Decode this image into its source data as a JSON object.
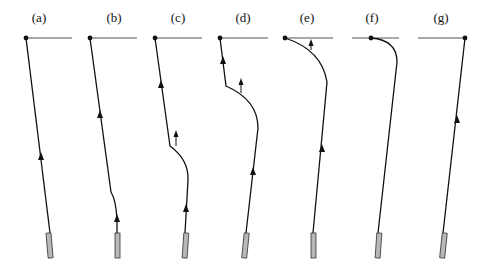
{
  "figure": {
    "panels": [
      {
        "id": "a",
        "label": "(a)"
      },
      {
        "id": "b",
        "label": "(b)"
      },
      {
        "id": "c",
        "label": "(c)"
      },
      {
        "id": "d",
        "label": "(d)"
      },
      {
        "id": "e",
        "label": "(e)"
      },
      {
        "id": "f",
        "label": "(f)"
      },
      {
        "id": "g",
        "label": "(g)"
      }
    ],
    "colors": {
      "line": "#111111",
      "rod_fill": "#b8b8b8",
      "rod_stroke": "#333333",
      "surface": "#333333"
    }
  }
}
